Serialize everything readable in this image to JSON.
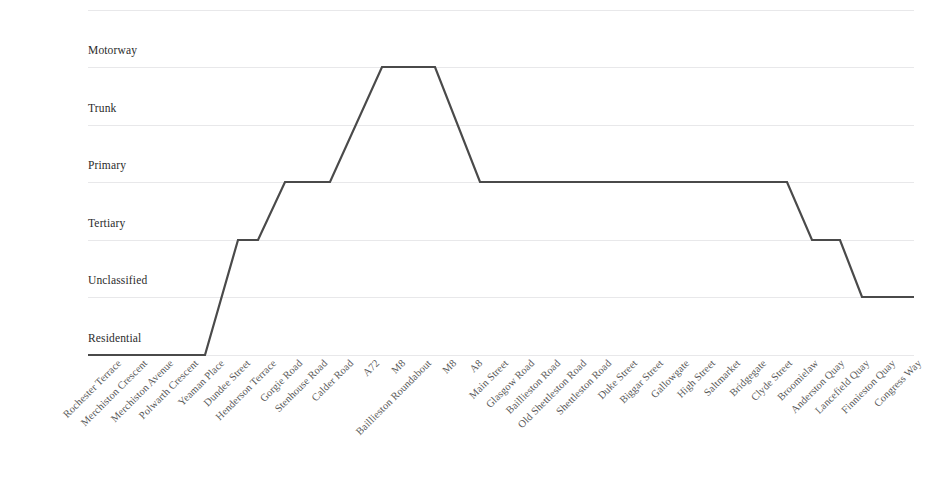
{
  "chart_data": {
    "type": "line",
    "title": "",
    "subtitle": "",
    "xlabel": "",
    "ylabel": "",
    "legend": [],
    "grid": true,
    "y_categories": [
      "Residential",
      "Unclassified",
      "Tertiary",
      "Primary",
      "Trunk",
      "Motorway"
    ],
    "y_tick_labels": [
      "Motorway",
      "Trunk",
      "Primary",
      "Tertiary",
      "Unclassified",
      "Residential"
    ],
    "ylim": [
      0,
      5
    ],
    "categories": [
      "Rochester Terrace",
      "Merchiston Crescent",
      "Merchiston Avenue",
      "Polwarth Crescent",
      "Yeaman Place",
      "Dundee Street",
      "Henderson Terrace",
      "Gorgie Road",
      "Stenhouse Road",
      "Calder Road",
      "A72",
      "M8",
      "Baillieston Roundabout",
      "M8",
      "A8",
      "Main Street",
      "Glasgow Road",
      "Baillieston Road",
      "Old Shettleston Road",
      "Shettleston Road",
      "Duke Street",
      "Biggar Street",
      "Gallowgate",
      "High Street",
      "Saltmarket",
      "Bridgegate",
      "Clyde Street",
      "Broomielaw",
      "Anderston Quay",
      "Lancefield Quay",
      "Finnieston Quay",
      "Congress Way"
    ],
    "values": [
      "Residential",
      "Residential",
      "Residential",
      "Residential",
      "Tertiary",
      "Tertiary",
      "Primary",
      "Primary",
      "Primary",
      "Primary",
      "Motorway",
      "Motorway",
      "Motorway",
      "Primary",
      "Primary",
      "Primary",
      "Primary",
      "Primary",
      "Primary",
      "Primary",
      "Primary",
      "Primary",
      "Primary",
      "Primary",
      "Primary",
      "Primary",
      "Primary",
      "Primary",
      "Tertiary",
      "Tertiary",
      "Unclassified",
      "Unclassified"
    ],
    "numeric_values": [
      0,
      0,
      0,
      0,
      2,
      2,
      3,
      3,
      3,
      3,
      5,
      5,
      5,
      3,
      3,
      3,
      3,
      3,
      3,
      3,
      3,
      3,
      3,
      3,
      3,
      3,
      3,
      3,
      2,
      2,
      1,
      1
    ],
    "points_px": [
      [
        88,
        355
      ],
      [
        205,
        355
      ],
      [
        238,
        240
      ],
      [
        258,
        240
      ],
      [
        285,
        182
      ],
      [
        330,
        182
      ],
      [
        382,
        67
      ],
      [
        435,
        67
      ],
      [
        480,
        182
      ],
      [
        787,
        182
      ],
      [
        812,
        240
      ],
      [
        840,
        240
      ],
      [
        862,
        297
      ],
      [
        914,
        297
      ]
    ],
    "gridlines_px": [
      10,
      67,
      125,
      182,
      240,
      297,
      355
    ],
    "y_label_px": [
      52,
      110,
      167,
      225,
      282,
      340
    ],
    "line_color": "#4a4a4a",
    "grid_color": "#e8e8ea",
    "line_width": 2.2,
    "background": "#ffffff"
  }
}
